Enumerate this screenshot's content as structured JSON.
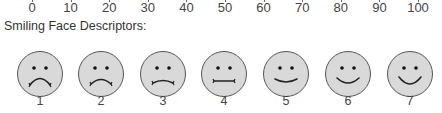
{
  "scale": {
    "ticks": [
      {
        "label": "0",
        "x": 32
      },
      {
        "label": "10",
        "x": 70.6
      },
      {
        "label": "20",
        "x": 109.2
      },
      {
        "label": "30",
        "x": 147.8
      },
      {
        "label": "40",
        "x": 186.4
      },
      {
        "label": "50",
        "x": 225
      },
      {
        "label": "60",
        "x": 263.6
      },
      {
        "label": "70",
        "x": 302.2
      },
      {
        "label": "80",
        "x": 340.8
      },
      {
        "label": "90",
        "x": 379.4
      },
      {
        "label": "100",
        "x": 418
      }
    ]
  },
  "descriptors": {
    "title": "Smiling Face Descriptors:",
    "face_fill": "#d9d9d9",
    "face_stroke": "#555555",
    "faces": [
      {
        "label": "1",
        "x": 40,
        "mouth": "frown-strong"
      },
      {
        "label": "2",
        "x": 101,
        "mouth": "frown-medium"
      },
      {
        "label": "3",
        "x": 163,
        "mouth": "frown-slight"
      },
      {
        "label": "4",
        "x": 224,
        "mouth": "neutral"
      },
      {
        "label": "5",
        "x": 286,
        "mouth": "smile-slight"
      },
      {
        "label": "6",
        "x": 348,
        "mouth": "smile-medium"
      },
      {
        "label": "7",
        "x": 410,
        "mouth": "smile-strong"
      }
    ]
  }
}
